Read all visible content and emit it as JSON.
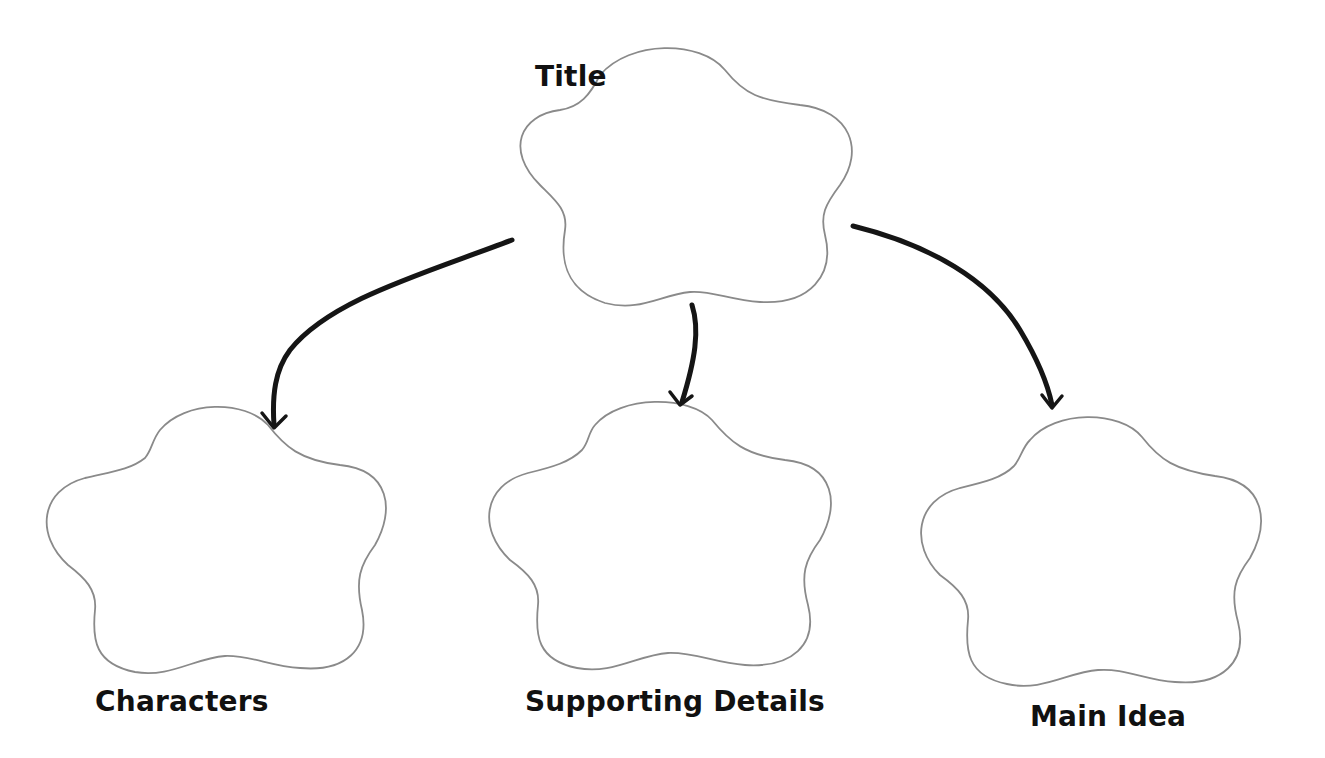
{
  "diagram": {
    "type": "story-map graphic organizer",
    "nodes": [
      {
        "id": "title",
        "label": "Title",
        "shape": "cloud",
        "position": "top-center"
      },
      {
        "id": "characters",
        "label": "Characters",
        "shape": "cloud",
        "position": "bottom-left"
      },
      {
        "id": "supporting_details",
        "label": "Supporting Details",
        "shape": "cloud",
        "position": "bottom-center"
      },
      {
        "id": "main_idea",
        "label": "Main Idea",
        "shape": "cloud",
        "position": "bottom-right"
      }
    ],
    "edges": [
      {
        "from": "title",
        "to": "characters"
      },
      {
        "from": "title",
        "to": "supporting_details"
      },
      {
        "from": "title",
        "to": "main_idea"
      }
    ]
  },
  "labels": {
    "title": "Title",
    "characters": "Characters",
    "supporting_details": "Supporting Details",
    "main_idea": "Main Idea"
  },
  "colors": {
    "background": "#ffffff",
    "cloud_outline": "#8a8a8a",
    "arrow": "#151515",
    "text": "#111111"
  }
}
